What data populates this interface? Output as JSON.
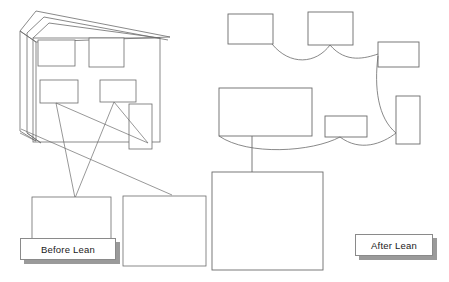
{
  "page": {
    "background_color": "#ffffff",
    "width": 449,
    "height": 282
  },
  "style": {
    "stroke_color": "#6b6b6b",
    "stroke_color_dark": "#555555",
    "shape_fill": "#ffffff",
    "label_border": "#8a8a8a",
    "label_shadow": "#9a9a9a",
    "text_color": "#1a1a1a"
  },
  "labels": {
    "before": {
      "text": "Before Lean",
      "name": "before-lean-label"
    },
    "after": {
      "text": "After Lean",
      "name": "after-lean-label"
    }
  },
  "before_lean_group": {
    "name": "before-lean-diagram",
    "sheet_stack": {
      "layers": 3,
      "description": "stacked overlapping sheets with angled top edges"
    },
    "inner_boxes": [
      {
        "name": "before-box-1",
        "x": 38,
        "y": 39,
        "w": 35,
        "h": 25
      },
      {
        "name": "before-box-2",
        "x": 89,
        "y": 38,
        "w": 34,
        "h": 28
      },
      {
        "name": "before-box-3",
        "x": 40,
        "y": 80,
        "w": 37,
        "h": 23
      },
      {
        "name": "before-box-4",
        "x": 100,
        "y": 80,
        "w": 35,
        "h": 22
      }
    ],
    "lower_boxes": [
      {
        "name": "before-lower-box-left",
        "x": 32,
        "y": 196,
        "w": 79,
        "h": 44
      },
      {
        "name": "before-lower-box-right",
        "x": 123,
        "y": 195,
        "w": 82,
        "h": 70
      }
    ],
    "tall_box": {
      "name": "before-tall-box",
      "x": 129,
      "y": 104,
      "w": 22,
      "h": 45
    }
  },
  "after_lean_group": {
    "name": "after-lean-diagram",
    "boxes": [
      {
        "name": "after-box-top-left",
        "x": 228,
        "y": 14,
        "w": 44,
        "h": 29
      },
      {
        "name": "after-box-top-mid",
        "x": 308,
        "y": 12,
        "w": 44,
        "h": 32
      },
      {
        "name": "after-box-top-right",
        "x": 378,
        "y": 42,
        "w": 40,
        "h": 24
      },
      {
        "name": "after-box-main",
        "x": 219,
        "y": 88,
        "w": 92,
        "h": 48
      },
      {
        "name": "after-box-small-mid",
        "x": 325,
        "y": 116,
        "w": 41,
        "h": 20
      },
      {
        "name": "after-box-tall-right",
        "x": 396,
        "y": 95,
        "w": 23,
        "h": 48
      },
      {
        "name": "after-box-bottom",
        "x": 212,
        "y": 172,
        "w": 110,
        "h": 98
      }
    ]
  },
  "connectors": {
    "before_lines": [
      "crossing straight leader lines from inner boxes down to lower boxes",
      "diagonal spaghetti flow lines"
    ],
    "after_curves": [
      "smooth curve top-left to top-mid",
      "smooth curve top-mid to top-right",
      "smooth curve top-right down to tall-right box",
      "smooth curve main box to small-mid box to tall-right box",
      "straight vertical line main box to bottom box"
    ]
  }
}
